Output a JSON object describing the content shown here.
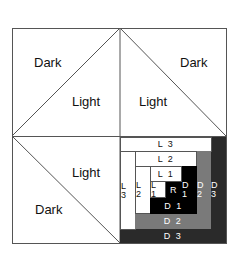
{
  "diagram": {
    "title": "",
    "quadrant_labels": {
      "top_left_dark": "Dark",
      "top_left_light": "Light",
      "top_right_light": "Light",
      "top_right_dark": "Dark",
      "bottom_left_light": "Light",
      "bottom_left_dark": "Dark"
    },
    "log_cabin": {
      "l3_top": "L 3",
      "l3_left": "L 3",
      "l2_top": "L 2",
      "l2_left": "L 2",
      "l1_top": "L 1",
      "l1_small": "L 1",
      "center": "R",
      "d1_right": "D 1",
      "d1_bottom": "D 1",
      "d2_right": "D 2",
      "d2_bottom": "D 2",
      "d3_right": "D 3",
      "d3_bottom": "D 3"
    },
    "colors": {
      "line": "#555555",
      "light": "#ffffff",
      "d1": "#000000",
      "d2": "#7a7a7a",
      "d3": "#2a2a2a"
    }
  }
}
